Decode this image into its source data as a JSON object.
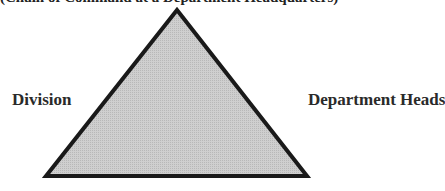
{
  "diagram": {
    "top_caption": "(Chain of Command at a Department Headquarters)",
    "shape": "triangle",
    "fill_color": "#c8c8c8",
    "stroke_color": "#1a1a1a",
    "labels": {
      "left": "Division",
      "right": "Department Heads"
    }
  }
}
